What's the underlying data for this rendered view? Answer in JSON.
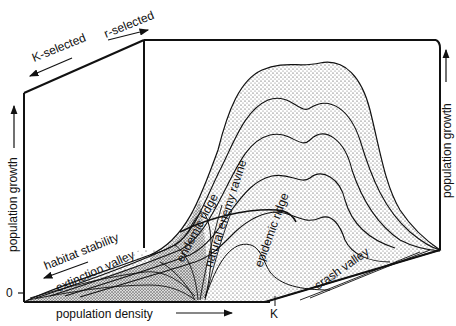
{
  "diagram": {
    "type": "3D population growth landscape",
    "axes": {
      "x_label": "population density",
      "x_marker": "K",
      "y_label_left": "population growth",
      "y_label_right": "population growth",
      "y_zero": "0",
      "depth_label": "habitat stability",
      "top_left_label": "K-selected",
      "top_right_label": "r-selected"
    },
    "features": [
      {
        "name": "extinction valley"
      },
      {
        "name": "endemic ridge"
      },
      {
        "name": "natural enemy ravine"
      },
      {
        "name": "epidemic ridge"
      },
      {
        "name": "crash valley"
      }
    ],
    "colors": {
      "ink": "#111111",
      "background": "#ffffff",
      "stipple": "#444444"
    }
  }
}
